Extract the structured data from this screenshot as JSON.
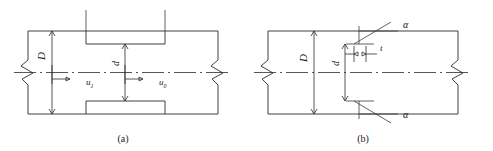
{
  "figure": {
    "panels": [
      {
        "id": "a",
        "caption": "(a)",
        "labels": {
          "outer_diameter": "D",
          "inner_diameter": "d",
          "velocity_left": "u",
          "velocity_left_subscript": "1",
          "velocity_right": "u",
          "velocity_right_subscript": "0"
        }
      },
      {
        "id": "b",
        "caption": "(b)",
        "labels": {
          "outer_diameter": "D",
          "inner_diameter": "d",
          "angle_top": "α",
          "angle_bottom": "α",
          "thickness": "t"
        }
      }
    ]
  },
  "colors": {
    "line": "#2b2b2b",
    "thin_line": "#3a3a3a",
    "text": "#1a1a1a",
    "background": "#ffffff"
  }
}
